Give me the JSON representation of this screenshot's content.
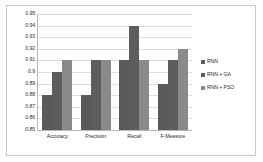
{
  "chart_data": {
    "type": "bar",
    "title": "",
    "xlabel": "",
    "ylabel": "",
    "categories": [
      "Accuracy",
      "Precision",
      "Recall",
      "F-Measure"
    ],
    "series": [
      {
        "name": "RNN",
        "color": "#595959",
        "values": [
          0.88,
          0.88,
          0.91,
          0.89
        ]
      },
      {
        "name": "RNN + GA",
        "color": "#5d5d5d",
        "values": [
          0.9,
          0.91,
          0.94,
          0.91
        ]
      },
      {
        "name": "RNN + PSO",
        "color": "#8a8a8a",
        "values": [
          0.91,
          0.91,
          0.91,
          0.92
        ]
      }
    ],
    "ylim": [
      0.85,
      0.95
    ],
    "ytick_values": [
      0.95,
      0.94,
      0.93,
      0.92,
      0.91,
      0.9,
      0.89,
      0.88,
      0.87,
      0.86,
      0.85
    ],
    "ytick_labels": [
      "0.95",
      "0.94",
      "0.93",
      "0.92",
      "0.91",
      "0.9",
      "0.89",
      "0.88",
      "0.87",
      "0.86",
      "0.85"
    ],
    "grid": "horizontal",
    "legend_position": "right"
  }
}
